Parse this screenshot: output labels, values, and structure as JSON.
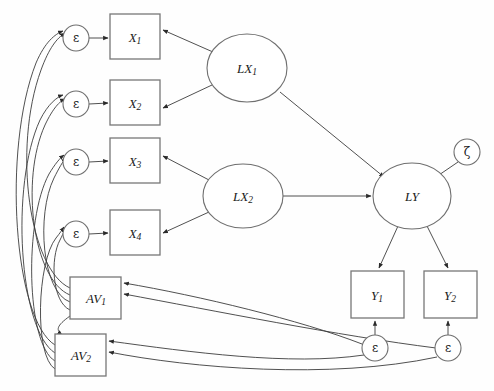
{
  "diagram": {
    "type": "path-diagram",
    "canvas": {
      "width": 494,
      "height": 391
    },
    "colors": {
      "background": "#fefefe",
      "node_stroke": "#6f6f6f",
      "box_stroke": "#777777",
      "edge_stroke": "#3c3c3c",
      "text": "#1a1a1a"
    },
    "observed_variables": [
      {
        "id": "X1",
        "base": "X",
        "sub": "1",
        "shape": "rect",
        "x": 110,
        "y": 14,
        "w": 50,
        "h": 45
      },
      {
        "id": "X2",
        "base": "X",
        "sub": "2",
        "shape": "rect",
        "x": 110,
        "y": 80,
        "w": 50,
        "h": 45
      },
      {
        "id": "X3",
        "base": "X",
        "sub": "3",
        "shape": "rect",
        "x": 110,
        "y": 138,
        "w": 50,
        "h": 45
      },
      {
        "id": "X4",
        "base": "X",
        "sub": "4",
        "shape": "rect",
        "x": 110,
        "y": 210,
        "w": 50,
        "h": 45
      },
      {
        "id": "Y1",
        "base": "Y",
        "sub": "1",
        "shape": "rect",
        "x": 351,
        "y": 271,
        "w": 53,
        "h": 47
      },
      {
        "id": "Y2",
        "base": "Y",
        "sub": "2",
        "shape": "rect",
        "x": 424,
        "y": 271,
        "w": 53,
        "h": 47
      },
      {
        "id": "AV1",
        "base": "AV",
        "sub": "1",
        "shape": "rect",
        "x": 70,
        "y": 277,
        "w": 51,
        "h": 42
      },
      {
        "id": "AV2",
        "base": "AV",
        "sub": "2",
        "shape": "rect",
        "x": 55,
        "y": 334,
        "w": 51,
        "h": 42
      }
    ],
    "latent_variables": [
      {
        "id": "LX1",
        "base": "LX",
        "sub": "1",
        "shape": "ellipse",
        "cx": 247,
        "cy": 68,
        "rx": 40,
        "ry": 34
      },
      {
        "id": "LX2",
        "base": "LX",
        "sub": "2",
        "shape": "ellipse",
        "cx": 243,
        "cy": 196,
        "rx": 40,
        "ry": 32
      },
      {
        "id": "LY",
        "base": "LY",
        "sub": "",
        "shape": "ellipse",
        "cx": 412,
        "cy": 196,
        "rx": 39,
        "ry": 33
      }
    ],
    "disturbances": [
      {
        "id": "eps_x1",
        "symbol": "ε",
        "shape": "circle",
        "cx": 76,
        "cy": 38,
        "r": 13
      },
      {
        "id": "eps_x2",
        "symbol": "ε",
        "shape": "circle",
        "cx": 76,
        "cy": 104,
        "r": 13
      },
      {
        "id": "eps_x3",
        "symbol": "ε",
        "shape": "circle",
        "cx": 76,
        "cy": 162,
        "r": 13
      },
      {
        "id": "eps_x4",
        "symbol": "ε",
        "shape": "circle",
        "cx": 76,
        "cy": 234,
        "r": 13
      },
      {
        "id": "eps_y1",
        "symbol": "ε",
        "shape": "circle",
        "cx": 375,
        "cy": 348,
        "r": 13
      },
      {
        "id": "eps_y2",
        "symbol": "ε",
        "shape": "circle",
        "cx": 448,
        "cy": 348,
        "r": 13
      },
      {
        "id": "zeta_ly",
        "symbol": "ζ",
        "shape": "circle",
        "cx": 467,
        "cy": 152,
        "r": 13
      }
    ],
    "paths": [
      {
        "from": "eps_x1",
        "to": "X1",
        "kind": "straight"
      },
      {
        "from": "eps_x2",
        "to": "X2",
        "kind": "straight"
      },
      {
        "from": "eps_x3",
        "to": "X3",
        "kind": "straight"
      },
      {
        "from": "eps_x4",
        "to": "X4",
        "kind": "straight"
      },
      {
        "from": "LX1",
        "to": "X1",
        "kind": "straight"
      },
      {
        "from": "LX1",
        "to": "X2",
        "kind": "straight"
      },
      {
        "from": "LX2",
        "to": "X3",
        "kind": "straight"
      },
      {
        "from": "LX2",
        "to": "X4",
        "kind": "straight"
      },
      {
        "from": "LX1",
        "to": "LY",
        "kind": "straight"
      },
      {
        "from": "LX2",
        "to": "LY",
        "kind": "straight"
      },
      {
        "from": "zeta_ly",
        "to": "LY",
        "kind": "straight"
      },
      {
        "from": "LY",
        "to": "Y1",
        "kind": "straight"
      },
      {
        "from": "LY",
        "to": "Y2",
        "kind": "straight"
      },
      {
        "from": "eps_y1",
        "to": "Y1",
        "kind": "straight"
      },
      {
        "from": "eps_y2",
        "to": "Y2",
        "kind": "straight"
      },
      {
        "from": "AV1",
        "to": "eps_x1",
        "kind": "curved"
      },
      {
        "from": "AV2",
        "to": "eps_x1",
        "kind": "curved"
      },
      {
        "from": "AV1",
        "to": "eps_x2",
        "kind": "curved"
      },
      {
        "from": "AV2",
        "to": "eps_x2",
        "kind": "curved"
      },
      {
        "from": "AV1",
        "to": "eps_x3",
        "kind": "curved"
      },
      {
        "from": "AV2",
        "to": "eps_x3",
        "kind": "curved"
      },
      {
        "from": "AV1",
        "to": "eps_x4",
        "kind": "curved"
      },
      {
        "from": "AV2",
        "to": "eps_x4",
        "kind": "curved"
      },
      {
        "from": "AV1",
        "to": "AV2",
        "kind": "curved"
      },
      {
        "from": "eps_y1",
        "to": "AV1",
        "kind": "curved"
      },
      {
        "from": "eps_y2",
        "to": "AV1",
        "kind": "curved"
      },
      {
        "from": "eps_y1",
        "to": "AV2",
        "kind": "curved"
      },
      {
        "from": "eps_y2",
        "to": "AV2",
        "kind": "curved"
      }
    ]
  }
}
